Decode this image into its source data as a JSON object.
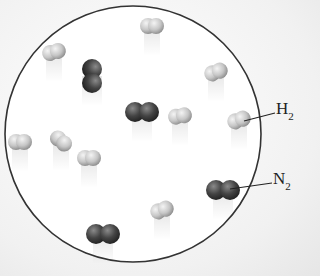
{
  "diagram": {
    "container": {
      "shape": "circle",
      "cx": 133,
      "cy": 134,
      "r": 128,
      "stroke": "#333333"
    },
    "colors": {
      "h2": "#c8c8c8",
      "n2": "#4a4a4a"
    },
    "labels": [
      {
        "id": "h2",
        "element": "H",
        "subscript": "2",
        "x": 276,
        "y": 103,
        "leader": [
          244,
          121,
          275,
          113
        ]
      },
      {
        "id": "n2",
        "element": "N",
        "subscript": "2",
        "x": 273,
        "y": 173,
        "leader": [
          230,
          189,
          272,
          183
        ]
      }
    ],
    "molecules": [
      {
        "type": "H2",
        "x": 152,
        "y": 26,
        "angle": 0
      },
      {
        "type": "H2",
        "x": 54,
        "y": 52,
        "angle": -15
      },
      {
        "type": "N2",
        "x": 92,
        "y": 76,
        "angle": 90
      },
      {
        "type": "H2",
        "x": 216,
        "y": 72,
        "angle": -20
      },
      {
        "type": "N2",
        "x": 142,
        "y": 112,
        "angle": 0
      },
      {
        "type": "H2",
        "x": 180,
        "y": 116,
        "angle": -10
      },
      {
        "type": "H2",
        "x": 239,
        "y": 120,
        "angle": -20
      },
      {
        "type": "H2",
        "x": 20,
        "y": 142,
        "angle": 0
      },
      {
        "type": "H2",
        "x": 61,
        "y": 141,
        "angle": 40
      },
      {
        "type": "H2",
        "x": 89,
        "y": 158,
        "angle": 0
      },
      {
        "type": "N2",
        "x": 223,
        "y": 190,
        "angle": 0
      },
      {
        "type": "H2",
        "x": 162,
        "y": 210,
        "angle": -20
      },
      {
        "type": "N2",
        "x": 103,
        "y": 234,
        "angle": 0
      }
    ]
  }
}
